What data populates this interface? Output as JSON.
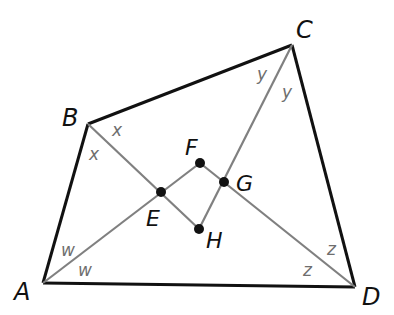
{
  "diagram": {
    "type": "quadrilateral-with-angle-bisectors",
    "colors": {
      "edge": "#111111",
      "bisector": "#808080",
      "point": "#111111",
      "angle_label": "#6e6e6e",
      "background": "#ffffff"
    },
    "vertices": {
      "A": {
        "label": "A",
        "x": 43,
        "y": 283
      },
      "B": {
        "label": "B",
        "x": 88,
        "y": 124
      },
      "C": {
        "label": "C",
        "x": 292,
        "y": 45
      },
      "D": {
        "label": "D",
        "x": 355,
        "y": 287
      }
    },
    "points": {
      "E": {
        "label": "E",
        "x": 161,
        "y": 192
      },
      "F": {
        "label": "F",
        "x": 200,
        "y": 163
      },
      "G": {
        "label": "G",
        "x": 224,
        "y": 182
      },
      "H": {
        "label": "H",
        "x": 199,
        "y": 229
      }
    },
    "edges": [
      "AB",
      "BC",
      "CD",
      "DA"
    ],
    "bisectors": [
      {
        "from": "A",
        "to": "F",
        "through": "E"
      },
      {
        "from": "B",
        "to": "H",
        "through": "E"
      },
      {
        "from": "C",
        "to": "H",
        "through": "G"
      },
      {
        "from": "D",
        "to": "F",
        "through": "G"
      }
    ],
    "inner_quadrilateral": [
      "E",
      "F",
      "G",
      "H"
    ],
    "angle_labels": {
      "A": [
        "w",
        "w"
      ],
      "B": [
        "x",
        "x"
      ],
      "C": [
        "y",
        "y"
      ],
      "D": [
        "z",
        "z"
      ]
    }
  }
}
